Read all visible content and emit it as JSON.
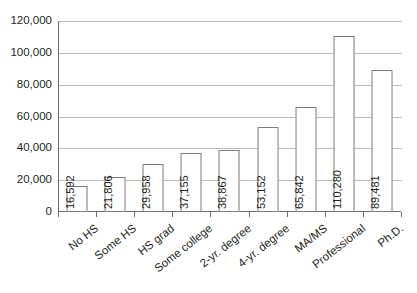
{
  "chart_data": {
    "type": "bar",
    "title": "",
    "xlabel": "",
    "ylabel": "",
    "ylim": [
      0,
      120000
    ],
    "grid": true,
    "legend": false,
    "categories": [
      "No HS",
      "Some HS",
      "HS grad",
      "Some college",
      "2-yr. degree",
      "4-yr. degree",
      "MA/MS",
      "Professional",
      "Ph.D."
    ],
    "values": [
      16592,
      21806,
      29958,
      37155,
      38867,
      53152,
      65842,
      110280,
      89481
    ],
    "data_labels": [
      "16,592",
      "21,806",
      "29,958",
      "37,155",
      "38,867",
      "53,152",
      "65,842",
      "110,280",
      "89,481"
    ],
    "ytick_values": [
      0,
      20000,
      40000,
      60000,
      80000,
      100000,
      120000
    ],
    "ytick_labels": [
      "0",
      "20,000",
      "40,000",
      "60,000",
      "80,000",
      "100,000",
      "120,000"
    ],
    "colors": {
      "bar_fill": "#ffffff",
      "bar_stroke": "#7b7b7b",
      "gridline": "#b9b9b9",
      "axis": "#6e6e6e",
      "text": "#231f20",
      "background": "#ffffff"
    }
  }
}
